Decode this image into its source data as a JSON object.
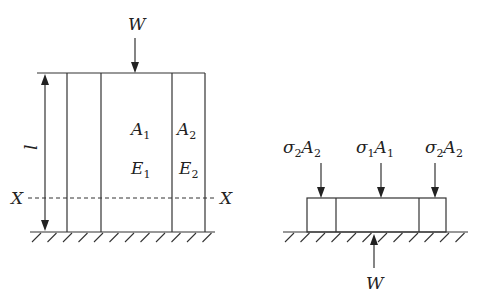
{
  "figure": {
    "left": {
      "load_label": "W",
      "length_label": "l",
      "section_label_left": "X",
      "section_label_right": "X",
      "inner_area_label": {
        "base": "A",
        "sub": "1"
      },
      "outer_area_label": {
        "base": "A",
        "sub": "2"
      },
      "inner_modulus_label": {
        "base": "E",
        "sub": "1"
      },
      "outer_modulus_label": {
        "base": "E",
        "sub": "2"
      }
    },
    "right": {
      "force_left": {
        "sigma_sub": "2",
        "area": "A",
        "area_sub": "2"
      },
      "force_center": {
        "sigma_sub": "1",
        "area": "A",
        "area_sub": "1"
      },
      "force_right": {
        "sigma_sub": "2",
        "area": "A",
        "area_sub": "2"
      },
      "sigma_symbol": "σ",
      "reaction_label": "W"
    }
  },
  "colors": {
    "line": "#333333",
    "background": "#ffffff"
  }
}
